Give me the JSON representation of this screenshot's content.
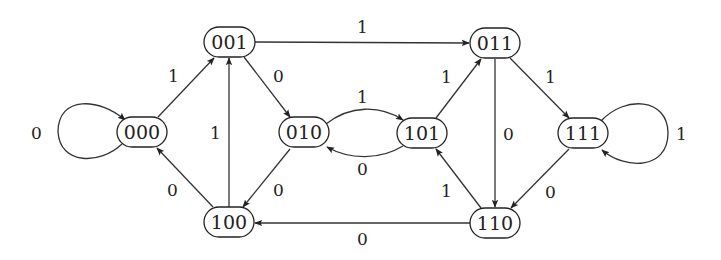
{
  "diagram": {
    "type": "state-transition-graph",
    "nodes": [
      {
        "id": "000",
        "label": "000",
        "x": 142,
        "y": 132
      },
      {
        "id": "001",
        "label": "001",
        "x": 229,
        "y": 42
      },
      {
        "id": "010",
        "label": "010",
        "x": 304,
        "y": 132
      },
      {
        "id": "100",
        "label": "100",
        "x": 229,
        "y": 222
      },
      {
        "id": "011",
        "label": "011",
        "x": 495,
        "y": 43
      },
      {
        "id": "101",
        "label": "101",
        "x": 422,
        "y": 133
      },
      {
        "id": "111",
        "label": "111",
        "x": 583,
        "y": 133
      },
      {
        "id": "110",
        "label": "110",
        "x": 495,
        "y": 223
      }
    ],
    "edges": [
      {
        "from": "000",
        "to": "000",
        "label": "0"
      },
      {
        "from": "000",
        "to": "001",
        "label": "1"
      },
      {
        "from": "001",
        "to": "010",
        "label": "0"
      },
      {
        "from": "001",
        "to": "011",
        "label": "1"
      },
      {
        "from": "100",
        "to": "000",
        "label": "0"
      },
      {
        "from": "100",
        "to": "001",
        "label": "1"
      },
      {
        "from": "010",
        "to": "100",
        "label": "0"
      },
      {
        "from": "010",
        "to": "101",
        "label": "1"
      },
      {
        "from": "101",
        "to": "010",
        "label": "0"
      },
      {
        "from": "101",
        "to": "011",
        "label": "1"
      },
      {
        "from": "110",
        "to": "101",
        "label": "1"
      },
      {
        "from": "011",
        "to": "110",
        "label": "0"
      },
      {
        "from": "011",
        "to": "111",
        "label": "1"
      },
      {
        "from": "111",
        "to": "110",
        "label": "0"
      },
      {
        "from": "111",
        "to": "111",
        "label": "1"
      },
      {
        "from": "110",
        "to": "100",
        "label": "0"
      }
    ]
  }
}
